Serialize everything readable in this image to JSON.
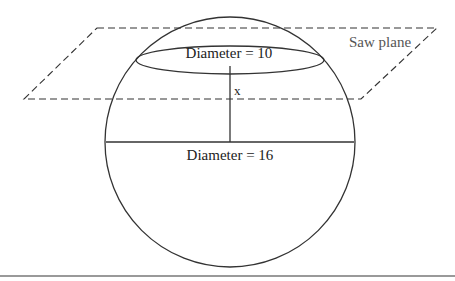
{
  "diagram": {
    "labels": {
      "saw_plane": "Saw plane",
      "small_diameter": "Diameter = 10",
      "large_diameter": "Diameter = 16",
      "distance": "x"
    },
    "colors": {
      "stroke": "#333333",
      "plane_label": "#555555",
      "footer_rule": "#999999"
    }
  }
}
